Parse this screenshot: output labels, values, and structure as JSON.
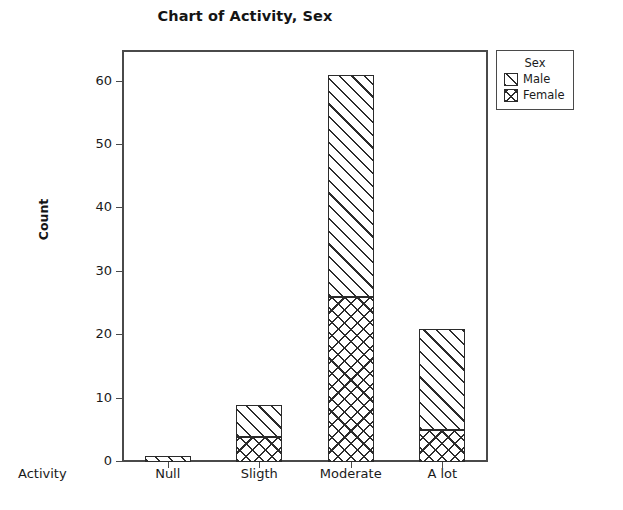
{
  "chart_data": {
    "type": "bar",
    "subtype": "stacked",
    "title": "Chart of Activity, Sex",
    "xlabel": "Activity",
    "ylabel": "Count",
    "categories": [
      "Null",
      "Sligth",
      "Moderate",
      "A lot"
    ],
    "series": [
      {
        "name": "Female",
        "values": [
          0,
          4,
          26,
          5
        ]
      },
      {
        "name": "Male",
        "values": [
          1,
          5,
          35,
          16
        ]
      }
    ],
    "totals": [
      1,
      9,
      61,
      21
    ],
    "legend_title": "Sex",
    "legend_entries": [
      "Male",
      "Female"
    ],
    "legend_position": "right",
    "ylim": [
      0,
      65
    ],
    "yticks": [
      0,
      10,
      20,
      30,
      40,
      50,
      60
    ],
    "ytick_labels": [
      "0",
      "10",
      "20",
      "30",
      "40",
      "50",
      "60"
    ],
    "grid": false,
    "fills": {
      "Male": "diagonal-hatch",
      "Female": "cross-hatch"
    },
    "colors": {
      "outline": "#2b2b2b",
      "axis": "#4a4a4a",
      "background": "#ffffff"
    }
  }
}
